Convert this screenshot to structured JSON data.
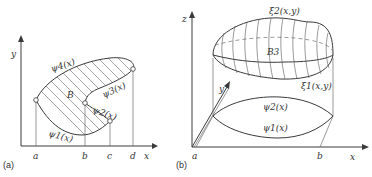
{
  "panel_a": {
    "caption": "(a)",
    "axis_x": "x",
    "axis_y": "y",
    "region_label": "B",
    "curves": {
      "psi4": "ψ4(x)",
      "psi3": "ψ3(x)",
      "psi2": "ψ2(x)",
      "psi1": "ψ1(x)"
    },
    "ticks": [
      "a",
      "b",
      "c",
      "d"
    ]
  },
  "panel_b": {
    "caption": "(b)",
    "axis_x": "x",
    "axis_y": "y",
    "axis_z": "z",
    "region_label": "B3",
    "surfaces": {
      "xi2": "ξ2(x,y)",
      "xi1": "ξ1(x,y)"
    },
    "curves": {
      "psi2": "ψ2(x)",
      "psi1": "ψ1(x)"
    },
    "ticks": [
      "a",
      "b"
    ]
  },
  "colors": {
    "line": "#3a3a3a",
    "background": "#ffffff"
  }
}
